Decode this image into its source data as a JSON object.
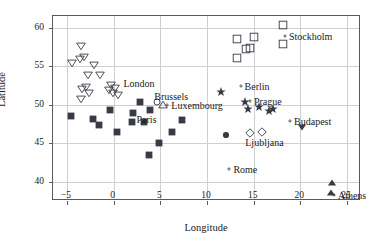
{
  "chart_data": {
    "type": "scatter",
    "title": "",
    "xlabel": "Longitude",
    "ylabel": "Latitude",
    "xlim": [
      -6.5,
      26.5
    ],
    "ylim": [
      37.5,
      61.5
    ],
    "xticks": [
      -5,
      0,
      5,
      10,
      15,
      20,
      25
    ],
    "xticklabels": [
      "−5",
      "0",
      "5",
      "10",
      "15",
      "20",
      "25"
    ],
    "yticks": [
      40,
      45,
      50,
      55,
      60
    ],
    "yticklabels": [
      "40",
      "45",
      "50",
      "55",
      "60"
    ],
    "grid": true,
    "legend": "none",
    "marker_color": "#3a3a46",
    "grid_color": "#cfcfcf",
    "frame_color": "#5a5a5a",
    "series": [
      {
        "name": "open-down-triangle-group",
        "marker": "triangle-down-open",
        "points": [
          {
            "x": -4.45,
            "y": 55.4
          },
          {
            "x": -3.45,
            "y": 57.6
          },
          {
            "x": -3.2,
            "y": 56.2
          },
          {
            "x": -3.6,
            "y": 55.9
          },
          {
            "x": -2.1,
            "y": 55.2
          },
          {
            "x": -2.7,
            "y": 53.9
          },
          {
            "x": -1.5,
            "y": 53.8
          },
          {
            "x": -3.0,
            "y": 52.3
          },
          {
            "x": -3.35,
            "y": 52.0
          },
          {
            "x": -3.5,
            "y": 50.7
          },
          {
            "x": -2.6,
            "y": 51.5
          },
          {
            "x": -0.25,
            "y": 52.6
          },
          {
            "x": -0.55,
            "y": 51.9
          },
          {
            "x": 0.15,
            "y": 52.2
          },
          {
            "x": -0.1,
            "y": 51.5
          },
          {
            "x": 0.45,
            "y": 51.3
          }
        ]
      },
      {
        "name": "filled-square-group",
        "marker": "square-filled",
        "points": [
          {
            "x": -4.6,
            "y": 48.5
          },
          {
            "x": -2.2,
            "y": 48.1
          },
          {
            "x": -1.6,
            "y": 47.4
          },
          {
            "x": -0.4,
            "y": 49.3
          },
          {
            "x": 0.35,
            "y": 46.5
          },
          {
            "x": 1.95,
            "y": 47.8
          },
          {
            "x": 2.1,
            "y": 48.9
          },
          {
            "x": 2.85,
            "y": 50.4
          },
          {
            "x": 3.25,
            "y": 47.7
          },
          {
            "x": 3.9,
            "y": 49.3
          },
          {
            "x": 3.75,
            "y": 43.5
          },
          {
            "x": 4.85,
            "y": 45.0
          },
          {
            "x": 6.2,
            "y": 46.4
          },
          {
            "x": 7.3,
            "y": 48.0
          }
        ]
      },
      {
        "name": "star-group",
        "marker": "star-filled",
        "points": [
          {
            "x": 11.5,
            "y": 51.7
          },
          {
            "x": 14.1,
            "y": 50.3
          },
          {
            "x": 14.4,
            "y": 49.4
          },
          {
            "x": 15.6,
            "y": 49.7
          },
          {
            "x": 16.6,
            "y": 49.2
          },
          {
            "x": 17.1,
            "y": 49.4
          }
        ]
      },
      {
        "name": "open-square-group",
        "marker": "square-open",
        "points": [
          {
            "x": 18.1,
            "y": 60.3
          },
          {
            "x": 13.2,
            "y": 58.5
          },
          {
            "x": 15.0,
            "y": 58.8
          },
          {
            "x": 14.2,
            "y": 57.2
          },
          {
            "x": 14.6,
            "y": 57.4
          },
          {
            "x": 13.2,
            "y": 56.1
          },
          {
            "x": 18.1,
            "y": 57.9
          }
        ]
      },
      {
        "name": "open-diamond-group",
        "marker": "diamond-open",
        "points": [
          {
            "x": 14.6,
            "y": 46.3
          },
          {
            "x": 15.9,
            "y": 46.4
          }
        ]
      },
      {
        "name": "filled-circle-group",
        "marker": "circle-filled",
        "points": [
          {
            "x": 12.0,
            "y": 46.0
          }
        ]
      },
      {
        "name": "open-circle-group",
        "marker": "circle-open",
        "points": [
          {
            "x": 4.6,
            "y": 50.4
          }
        ]
      },
      {
        "name": "open-up-triangle-group",
        "marker": "triangle-up-open",
        "points": [
          {
            "x": 5.25,
            "y": 49.9
          }
        ]
      },
      {
        "name": "filled-down-triangle-group",
        "marker": "triangle-down-filled",
        "points": [
          {
            "x": 20.2,
            "y": 47.1
          }
        ]
      },
      {
        "name": "filled-up-triangle-group",
        "marker": "triangle-up-filled",
        "points": [
          {
            "x": 23.4,
            "y": 39.8
          },
          {
            "x": 23.3,
            "y": 38.5
          }
        ]
      }
    ],
    "annotations": [
      {
        "label": "Stockholm",
        "x": 18.35,
        "y": 58.85,
        "anchor": "left",
        "dot": true
      },
      {
        "label": "London",
        "x": 1.05,
        "y": 52.85,
        "anchor": "left",
        "dot": false
      },
      {
        "label": "Brussels",
        "x": 4.35,
        "y": 51.1,
        "anchor": "left",
        "dot": false
      },
      {
        "label": "Luxembourg",
        "x": 5.75,
        "y": 49.9,
        "anchor": "left",
        "dot": true
      },
      {
        "label": "Paris",
        "x": 2.45,
        "y": 48.1,
        "anchor": "left",
        "dot": false
      },
      {
        "label": "Berlin",
        "x": 13.6,
        "y": 52.4,
        "anchor": "left",
        "dot": true
      },
      {
        "label": "Prague",
        "x": 14.6,
        "y": 50.5,
        "anchor": "left",
        "dot": true
      },
      {
        "label": "Budapest",
        "x": 18.9,
        "y": 47.9,
        "anchor": "left",
        "dot": true
      },
      {
        "label": "Ljubljana",
        "x": 14.1,
        "y": 45.1,
        "anchor": "left",
        "dot": false
      },
      {
        "label": "Rome",
        "x": 12.4,
        "y": 41.6,
        "anchor": "left",
        "dot": true
      },
      {
        "label": "Athens",
        "x": 23.6,
        "y": 38.3,
        "anchor": "left",
        "dot": true
      }
    ]
  }
}
